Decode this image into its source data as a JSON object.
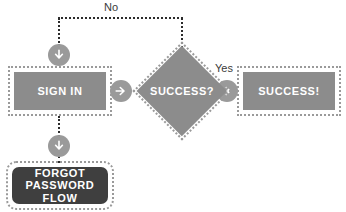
{
  "diagram": {
    "type": "flowchart",
    "background_color": "#ffffff",
    "colors": {
      "node_fill": "#8c8c8c",
      "node_dark_fill": "#3f3f3f",
      "node_text": "#ffffff",
      "dotted_outline": "#9a9a9a",
      "connector_line": "#2b2b2b",
      "connector_circle": "#9a9a9a",
      "connector_arrow": "#ffffff",
      "edge_label_text": "#3a3a3a"
    },
    "nodes": {
      "sign_in": {
        "label": "SIGN IN",
        "shape": "rectangle"
      },
      "decision": {
        "label": "SUCCESS?",
        "shape": "diamond"
      },
      "success": {
        "label": "SUCCESS!",
        "shape": "rectangle"
      },
      "forgot": {
        "label_line1": "FORGOT",
        "label_line2": "PASSWORD FLOW",
        "shape": "rounded-rectangle"
      }
    },
    "edges": {
      "no_label": "No",
      "yes_label": "Yes"
    },
    "icons": {
      "arrow_right": "arrow-right-icon",
      "arrow_down": "arrow-down-icon"
    }
  }
}
